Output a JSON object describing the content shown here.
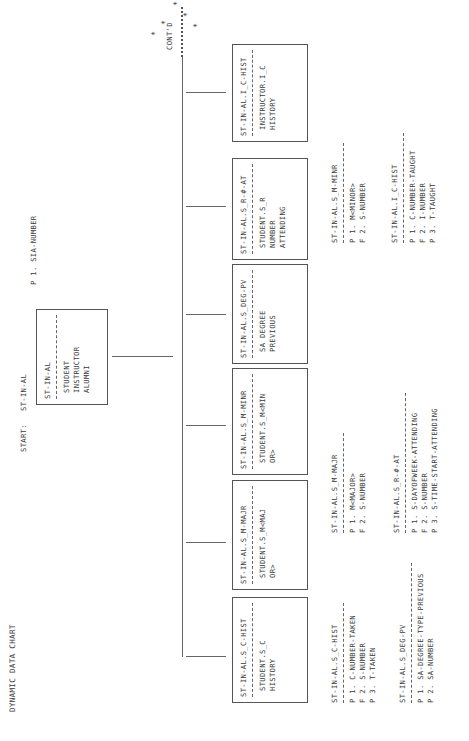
{
  "header": {
    "title": "DYNAMIC DATA CHART",
    "start_label": "START:",
    "start_value": "ST-IN-AL",
    "root_key": "P 1. SIA-NUMBER"
  },
  "root_box": {
    "name": "ST-IN-AL",
    "lines": [
      "STUDENT",
      "INSTRUCTOR",
      "ALUMNI"
    ]
  },
  "continued": {
    "label": "CONT'D",
    "star": "*"
  },
  "children": [
    {
      "name": "ST-IN-AL.S_C-HIST",
      "lines": [
        "STUDENT.S_C",
        "HISTORY"
      ]
    },
    {
      "name": "ST-IN-AL.S_M-MAJR",
      "lines": [
        "STUDENT.S_M<MAJ",
        "OR>"
      ]
    },
    {
      "name": "ST-IN-AL.S_M-MINR",
      "lines": [
        "STUDENT.S_M<MIN",
        "OR>"
      ]
    },
    {
      "name": "ST-IN-AL.S_DEG-PV",
      "lines": [
        "SA DEGREE",
        "PREVIOUS"
      ]
    },
    {
      "name": "ST-IN-AL.S_R-#-AT",
      "lines": [
        "STUDENT.S_R",
        "NUMBER",
        "ATTENDING"
      ]
    },
    {
      "name": "ST-IN-AL.I_C-HIST",
      "lines": [
        "INSTRUCTOR.I_C",
        "HISTORY"
      ]
    }
  ],
  "attribute_lists": [
    {
      "name": "ST-IN-AL.S_C-HIST",
      "rows": [
        "P 1. C-NUMBER-TAKEN",
        "F 2. S-NUMBER",
        "P 3. T-TAKEN"
      ]
    },
    {
      "name": "ST-IN-AL.S_DEG-PV",
      "rows": [
        "P 1. SA-DEGREE-TYPE-PREVIOUS",
        "P 2. SA-NUMBER"
      ]
    },
    {
      "name": "ST-IN-AL.S_M-MAJR",
      "rows": [
        "P 1. M<MAJOR>",
        "F 2. S-NUMBER"
      ]
    },
    {
      "name": "ST-IN-AL.S_R-#-AT",
      "rows": [
        "P 1. S-DAYOFWEEK-ATTENDING",
        "F 2. S-NUMBER",
        "P 3. S-TIME-START-ATTENDING"
      ]
    },
    {
      "name": "ST-IN-AL.S_M-MINR",
      "rows": [
        "P 1. M<MINOR>",
        "F 2. S-NUMBER"
      ]
    },
    {
      "name": "ST-IN-AL.I_C-HIST",
      "rows": [
        "P 1. C-NUMBER-TAUGHT",
        "F 2. I-NUMBER",
        "P 3. T-TAUGHT"
      ]
    }
  ]
}
